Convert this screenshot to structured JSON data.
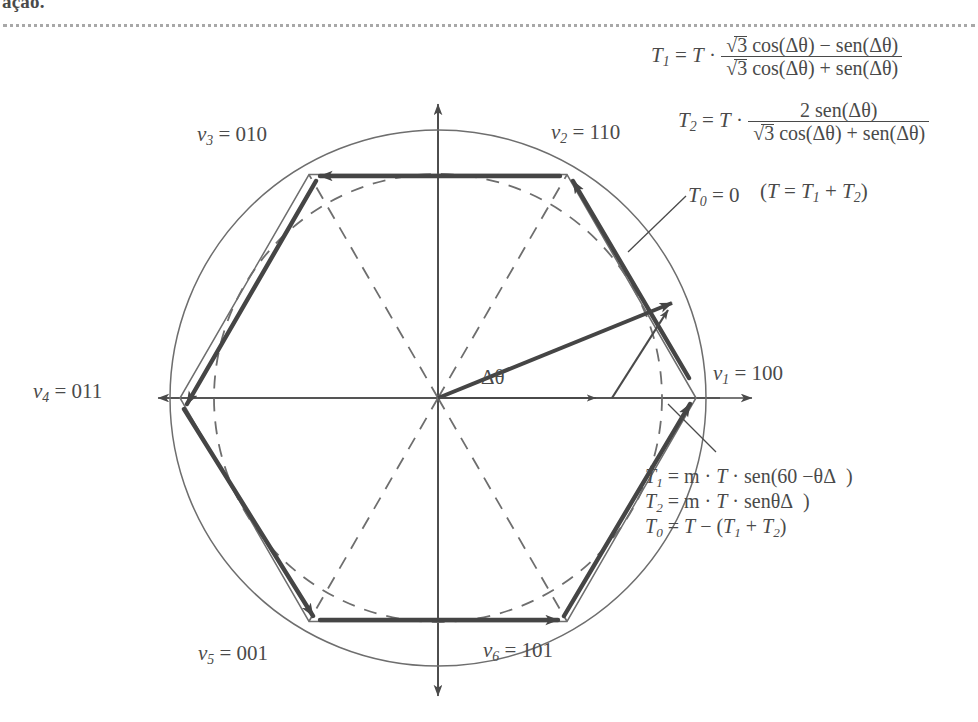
{
  "page": {
    "cropped_text_fragment": "ação."
  },
  "diagram": {
    "center_label": "Δθ",
    "vectors": [
      {
        "name": "v1",
        "label": "v₁ = 100",
        "html": "<i class=\"v it\">v</i><sub>1</sub> = 100",
        "angle_deg": 0
      },
      {
        "name": "v2",
        "label": "v₂ = 110",
        "html": "<i class=\"v it\">v</i><sub>2</sub> = 110",
        "angle_deg": 60
      },
      {
        "name": "v3",
        "label": "v₃ = 010",
        "html": "<i class=\"v it\">v</i><sub>3</sub> = 010",
        "angle_deg": 120
      },
      {
        "name": "v4",
        "label": "v₄ = 011",
        "html": "<i class=\"v it\">v</i><sub>4</sub> = 011",
        "angle_deg": 180
      },
      {
        "name": "v5",
        "label": "v₅ = 001",
        "html": "<i class=\"v it\">v</i><sub>5</sub> = 001",
        "angle_deg": 240
      },
      {
        "name": "v6",
        "label": "v₆ = 101",
        "html": "<i class=\"v it\">v</i><sub>6</sub> = 101",
        "angle_deg": 300
      }
    ],
    "annotations": {
      "t0_zero": "T₀ = 0",
      "t_sum": "(T = T₁ + T₂)"
    },
    "equations_top": {
      "t1": "T₁ = T · (√3 cos(Δθ) − sen(Δθ)) / (√3 cos(Δθ) + sen(Δθ))",
      "t2": "T₂ = T · (2 sen(Δθ)) / (√3 cos(Δθ) + sen(Δθ))"
    },
    "equations_lower": {
      "t1": "T₁ = m · T · sen(60 − Δθ)",
      "t2": "T₂ = m · T · sen(Δθ)",
      "t0": "T₀ = T − (T₁ + T₂)"
    },
    "geometry": {
      "center_x": 438,
      "center_y": 398,
      "hexagon_radius": 258,
      "inscribed_circle_radius": 224,
      "circumscribed_circle_radius": 268,
      "reference_vector_angle_deg": 21,
      "axis_extent": 300
    },
    "colors": {
      "ink": "#4a4a4a",
      "ink_light": "#6e6e6e",
      "bold_stroke": "#454545"
    }
  }
}
